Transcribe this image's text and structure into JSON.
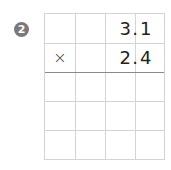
{
  "problem": {
    "number": "2",
    "operator": "×",
    "row1": [
      "",
      "",
      "3",
      ".",
      "1"
    ],
    "multiplicand_digits": {
      "int": "3",
      "dot": ".",
      "frac": "1"
    },
    "multiplier_digits": {
      "int": "2",
      "dot": ".",
      "frac": "4"
    }
  },
  "grid": {
    "columns": 4,
    "rows": 5,
    "answer_rows": 3
  }
}
